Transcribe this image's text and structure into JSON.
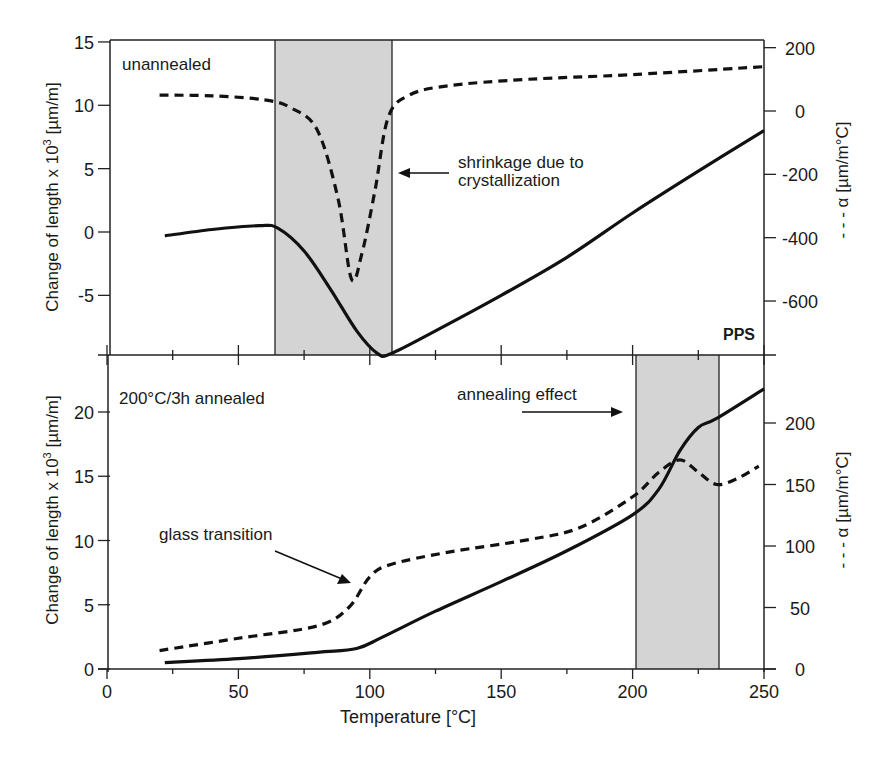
{
  "chart_data": [
    {
      "type": "line",
      "panel": "top",
      "title": "",
      "panel_label": "unannealed",
      "material_label": "PPS",
      "xlabel": "Temperature [°C]",
      "ylabel": "Change of length x 10³ [µm/m]",
      "y2label": "- - - α [µm/m°C]",
      "xlim": [
        0,
        250
      ],
      "ylim": [
        -9.7,
        15
      ],
      "y2lim": [
        -770,
        205
      ],
      "yticks": [
        "15",
        "10",
        "5",
        "0",
        "-5"
      ],
      "y2ticks": [
        "200",
        "0",
        "-200",
        "-400",
        "-600"
      ],
      "shaded_region": [
        63,
        107
      ],
      "annotation": "shrinkage due to crystallization",
      "series": [
        {
          "name": "Change of length (solid)",
          "axis": "left",
          "style": "solid",
          "x": [
            22,
            40,
            58,
            65,
            75,
            85,
            95,
            103,
            108,
            125,
            150,
            175,
            200,
            225,
            250
          ],
          "values": [
            -0.3,
            0.2,
            0.5,
            0.3,
            -1.5,
            -4.5,
            -7.8,
            -9.6,
            -9.6,
            -7.8,
            -5,
            -2,
            1.5,
            4.8,
            8
          ]
        },
        {
          "name": "α (dashed)",
          "axis": "right",
          "style": "dashed",
          "x": [
            20,
            40,
            60,
            70,
            80,
            88,
            93,
            97,
            102,
            107,
            115,
            130,
            160,
            200,
            250
          ],
          "values": [
            50,
            48,
            35,
            10,
            -60,
            -280,
            -530,
            -450,
            -250,
            -20,
            50,
            80,
            100,
            115,
            140
          ]
        }
      ]
    },
    {
      "type": "line",
      "panel": "bottom",
      "title": "",
      "panel_label": "200°C/3h annealed",
      "xlabel": "Temperature [°C]",
      "ylabel": "Change of length x 10³ [µm/m]",
      "y2label": "- - - α [µm/m°C]",
      "xlim": [
        0,
        250
      ],
      "ylim": [
        0,
        24.4
      ],
      "y2lim": [
        0,
        255
      ],
      "xticks": [
        "0",
        "50",
        "100",
        "150",
        "200",
        "250"
      ],
      "yticks": [
        "20",
        "15",
        "10",
        "5",
        "0"
      ],
      "y2ticks": [
        "200",
        "150",
        "100",
        "50",
        "0"
      ],
      "shaded_region": [
        201,
        233
      ],
      "annotations": [
        "glass transition",
        "annealing effect"
      ],
      "series": [
        {
          "name": "Change of length (solid)",
          "axis": "left",
          "style": "solid",
          "x": [
            22,
            50,
            80,
            95,
            105,
            125,
            150,
            175,
            200,
            210,
            218,
            225,
            232,
            250
          ],
          "values": [
            0.5,
            0.8,
            1.3,
            1.6,
            2.5,
            4.5,
            6.8,
            9.2,
            12,
            14,
            17,
            18.8,
            19.5,
            21.8
          ]
        },
        {
          "name": "α (dashed)",
          "axis": "right",
          "style": "dashed",
          "x": [
            20,
            50,
            80,
            92,
            100,
            108,
            130,
            160,
            180,
            200,
            210,
            218,
            225,
            232,
            240,
            248
          ],
          "values": [
            15,
            25,
            35,
            50,
            75,
            85,
            95,
            105,
            115,
            140,
            160,
            170,
            160,
            150,
            155,
            165
          ]
        }
      ]
    }
  ],
  "labels": {
    "top_panel": "unannealed",
    "pps": "PPS",
    "shrink_1": "shrinkage due to",
    "shrink_2": "crystallization",
    "bottom_panel": "200°C/3h annealed",
    "annealing": "annealing effect",
    "glass": "glass transition",
    "xlabel": "Temperature [°C]",
    "ylabel_top": "Change of length x 10",
    "ylabel_exp": "3",
    "ylabel_unit": " [µm/m]",
    "y2label": "- - - α [µm/m°C]"
  },
  "colors": {
    "line": "#111111",
    "shade": "#d4d4d4",
    "axis": "#222222"
  }
}
